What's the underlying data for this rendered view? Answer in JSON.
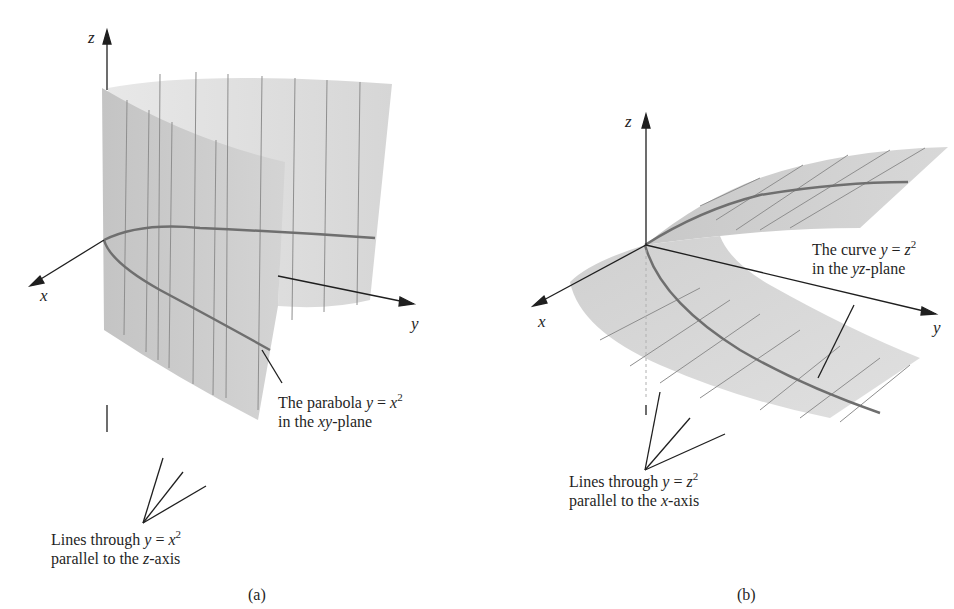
{
  "panel_a": {
    "axes": {
      "x": "x",
      "y": "y",
      "z": "z"
    },
    "callout_parabola": {
      "line1_prefix": "The parabola ",
      "line1_var": "y",
      "line1_eq": " = ",
      "line1_base": "x",
      "line1_exp": "2",
      "line2_prefix": "in the ",
      "line2_var": "xy",
      "line2_suffix": "-plane"
    },
    "callout_lines": {
      "line1_prefix": "Lines through ",
      "line1_var": "y",
      "line1_eq": " = ",
      "line1_base": "x",
      "line1_exp": "2",
      "line2_prefix": "parallel to the ",
      "line2_var": "z",
      "line2_suffix": "-axis"
    },
    "caption": "(a)"
  },
  "panel_b": {
    "axes": {
      "x": "x",
      "y": "y",
      "z": "z"
    },
    "callout_curve": {
      "line1_prefix": "The curve ",
      "line1_var": "y",
      "line1_eq": " = ",
      "line1_base": "z",
      "line1_exp": "2",
      "line2_prefix": "in the ",
      "line2_var": "yz",
      "line2_suffix": "-plane"
    },
    "callout_lines": {
      "line1_prefix": "Lines through ",
      "line1_var": "y",
      "line1_eq": " = ",
      "line1_base": "z",
      "line1_exp": "2",
      "line2_prefix": "parallel to the ",
      "line2_var": "x",
      "line2_suffix": "-axis"
    },
    "caption": "(b)"
  },
  "colors": {
    "surface_dark": "#c2c2c2",
    "surface_light": "#dedede",
    "rule_lines": "#8e8e8e",
    "curve": "#6f6f6f",
    "axis": "#1f1f1f"
  }
}
